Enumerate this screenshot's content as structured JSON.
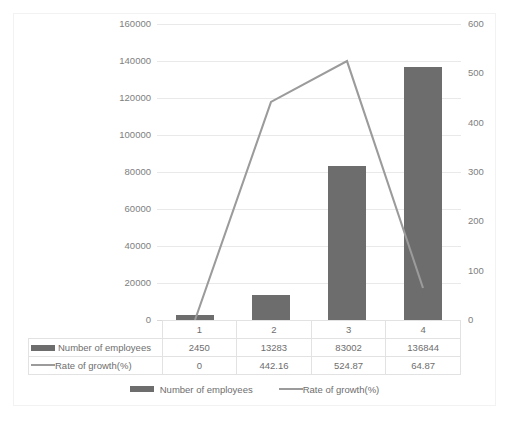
{
  "chart_data": {
    "type": "bar",
    "title": "",
    "subtitle": "",
    "xlabel": "",
    "ylabel": "",
    "categories": [
      "1",
      "2",
      "3",
      "4"
    ],
    "grid": true,
    "legend_position": "bottom",
    "series": [
      {
        "name": "Number of employees",
        "type": "bar",
        "axis": "left",
        "color": "#6d6d6d",
        "values": [
          2450,
          13283,
          83002,
          136844
        ],
        "value_labels": [
          "2450",
          "13283",
          "83002",
          "136844"
        ]
      },
      {
        "name": "Rate of growth(%)",
        "type": "line",
        "axis": "right",
        "color": "#9b9b9b",
        "values": [
          0,
          442.16,
          524.87,
          64.87
        ],
        "value_labels": [
          "0",
          "442.16",
          "524.87",
          "64.87"
        ]
      }
    ],
    "left_axis": {
      "label": "",
      "ylim": [
        0,
        160000
      ],
      "tick_step": 20000,
      "ticks": [
        0,
        20000,
        40000,
        60000,
        80000,
        100000,
        120000,
        140000,
        160000
      ],
      "tick_labels": [
        "0",
        "20000",
        "40000",
        "60000",
        "80000",
        "100000",
        "120000",
        "140000",
        "160000"
      ]
    },
    "right_axis": {
      "label": "",
      "ylim": [
        0,
        600
      ],
      "tick_step": 100,
      "ticks": [
        0,
        100,
        200,
        300,
        400,
        500,
        600
      ],
      "tick_labels": [
        "0",
        "100",
        "200",
        "300",
        "400",
        "500",
        "600"
      ]
    },
    "data_table": {
      "header_row": [
        "1",
        "2",
        "3",
        "4"
      ],
      "rows": [
        {
          "label": "Number of employees",
          "marker": "bar-swatch",
          "cells": [
            "2450",
            "13283",
            "83002",
            "136844"
          ]
        },
        {
          "label": "Rate of growth(%)",
          "marker": "line-swatch",
          "cells": [
            "0",
            "442.16",
            "524.87",
            "64.87"
          ]
        }
      ]
    },
    "legend": [
      {
        "label": "Number of employees",
        "marker": "bar-swatch",
        "color": "#6d6d6d"
      },
      {
        "label": "Rate of growth(%)",
        "marker": "line-swatch",
        "color": "#9b9b9b"
      }
    ],
    "colors": {
      "bar": "#6d6d6d",
      "line": "#9b9b9b",
      "gridline": "#e9e9e9",
      "axis_text": "#808080",
      "table_text": "#6e6e6e",
      "table_border": "#e2e2e2",
      "background": "#ffffff"
    }
  }
}
